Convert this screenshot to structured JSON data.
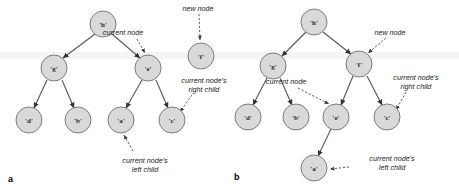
{
  "figure": {
    "background_color": "#ffffff",
    "node_fill": "#d9d9d9",
    "node_stroke": "#7d7d7d",
    "edge_color": "#555555",
    "leader_color": "#4a4a4a",
    "text_color": "#1a1a1a"
  },
  "panels": [
    {
      "id": "a",
      "label": "a",
      "nodes": [
        {
          "id": "a-h",
          "label": "'h'",
          "cx": 103,
          "cy": 24,
          "r": 13
        },
        {
          "id": "a-g",
          "label": "'g'",
          "cx": 54,
          "cy": 68,
          "r": 13
        },
        {
          "id": "a-e",
          "label": "'e'",
          "cx": 148,
          "cy": 68,
          "r": 13
        },
        {
          "id": "a-f",
          "label": "'f'",
          "cx": 201,
          "cy": 56,
          "r": 13
        },
        {
          "id": "a-d",
          "label": "'d'",
          "cx": 29,
          "cy": 120,
          "r": 13
        },
        {
          "id": "a-b",
          "label": "'b'",
          "cx": 78,
          "cy": 120,
          "r": 13
        },
        {
          "id": "a-a",
          "label": "'a'",
          "cx": 121,
          "cy": 120,
          "r": 13
        },
        {
          "id": "a-c",
          "label": "'c'",
          "cx": 172,
          "cy": 120,
          "r": 13
        }
      ],
      "edges": [
        {
          "from": "a-h",
          "to": "a-g"
        },
        {
          "from": "a-h",
          "to": "a-e"
        },
        {
          "from": "a-g",
          "to": "a-d"
        },
        {
          "from": "a-g",
          "to": "a-b"
        },
        {
          "from": "a-e",
          "to": "a-a"
        },
        {
          "from": "a-e",
          "to": "a-c"
        }
      ],
      "annotations": [
        {
          "id": "a-annot-current",
          "text": "current node",
          "x": 123,
          "y": 35,
          "align": "middle",
          "target": "a-e"
        },
        {
          "id": "a-annot-new",
          "text": "new node",
          "x": 198,
          "y": 10,
          "align": "middle",
          "target": "a-f"
        },
        {
          "id": "a-annot-right",
          "text": "current node's",
          "text2": "right child",
          "x": 204,
          "y": 83,
          "align": "middle",
          "target": "a-c"
        },
        {
          "id": "a-annot-left",
          "text": "current node's",
          "text2": "left child",
          "x": 145,
          "y": 164,
          "align": "middle",
          "target": "a-a"
        }
      ]
    },
    {
      "id": "b",
      "label": "b",
      "nodes": [
        {
          "id": "b-h",
          "label": "'h'",
          "cx": 314,
          "cy": 22,
          "r": 13
        },
        {
          "id": "b-g",
          "label": "'g'",
          "cx": 273,
          "cy": 66,
          "r": 13
        },
        {
          "id": "b-f",
          "label": "'f'",
          "cx": 359,
          "cy": 64,
          "r": 13
        },
        {
          "id": "b-d",
          "label": "'d'",
          "cx": 248,
          "cy": 117,
          "r": 13
        },
        {
          "id": "b-b",
          "label": "'b'",
          "cx": 296,
          "cy": 117,
          "r": 13
        },
        {
          "id": "b-e",
          "label": "'e'",
          "cx": 336,
          "cy": 117,
          "r": 13
        },
        {
          "id": "b-c",
          "label": "'c'",
          "cx": 387,
          "cy": 117,
          "r": 13
        },
        {
          "id": "b-a",
          "label": "'a'",
          "cx": 314,
          "cy": 168,
          "r": 13
        }
      ],
      "edges": [
        {
          "from": "b-h",
          "to": "b-g"
        },
        {
          "from": "b-h",
          "to": "b-f"
        },
        {
          "from": "b-g",
          "to": "b-d"
        },
        {
          "from": "b-g",
          "to": "b-b"
        },
        {
          "from": "b-f",
          "to": "b-e"
        },
        {
          "from": "b-f",
          "to": "b-c"
        },
        {
          "from": "b-e",
          "to": "b-a"
        }
      ],
      "annotations": [
        {
          "id": "b-annot-new",
          "text": "new node",
          "x": 390,
          "y": 34,
          "align": "middle",
          "target": "b-f"
        },
        {
          "id": "b-annot-current",
          "text": "current node",
          "x": 286,
          "y": 84,
          "align": "middle",
          "target": "b-e"
        },
        {
          "id": "b-annot-right",
          "text": "current node's",
          "text2": "right child",
          "x": 416,
          "y": 80,
          "align": "middle",
          "target": "b-c"
        },
        {
          "id": "b-annot-left",
          "text": "current node's",
          "text2": "left child",
          "x": 366,
          "y": 161,
          "align": "middle",
          "target": "b-a"
        }
      ]
    }
  ]
}
